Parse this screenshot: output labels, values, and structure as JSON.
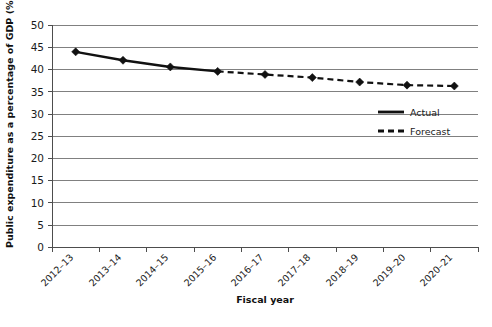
{
  "chart_data": {
    "type": "line",
    "title": "",
    "xlabel": "Fiscal year",
    "ylabel": "Public expenditure as a percentage of GDP (%)",
    "categories": [
      "2012–13",
      "2013–14",
      "2014–15",
      "2015–16",
      "2016–17",
      "2017–18",
      "2018–19",
      "2019–20",
      "2020–21"
    ],
    "ylim": [
      0,
      50
    ],
    "yticks": [
      0,
      5,
      10,
      15,
      20,
      25,
      30,
      35,
      40,
      45,
      50
    ],
    "ytick_labels": [
      "0",
      "5",
      "10",
      "15",
      "20",
      "25",
      "30",
      "35",
      "40",
      "45",
      "50"
    ],
    "grid": true,
    "legend_position": "right-inside",
    "series": [
      {
        "name": "Actual",
        "style": "solid",
        "x": [
          "2012–13",
          "2013–14",
          "2014–15",
          "2015–16"
        ],
        "values": [
          44.0,
          42.1,
          40.6,
          39.6
        ]
      },
      {
        "name": "Forecast",
        "style": "dashed",
        "x": [
          "2015–16",
          "2016–17",
          "2017–18",
          "2018–19",
          "2019–20",
          "2020–21"
        ],
        "values": [
          39.6,
          38.9,
          38.2,
          37.2,
          36.5,
          36.3
        ]
      }
    ],
    "colors": {
      "series_line": "#111111",
      "marker": "#111111",
      "gridline": "#808080",
      "axis": "#4d4d4d",
      "background": "#ffffff"
    }
  },
  "legend": {
    "items": [
      {
        "label": "Actual",
        "style": "solid"
      },
      {
        "label": "Forecast",
        "style": "dashed"
      }
    ]
  },
  "axes": {
    "y_title": "Public expenditure as a percentage of GDP (%)",
    "x_title": "Fiscal year",
    "y_ticks": [
      "50",
      "45",
      "40",
      "35",
      "30",
      "25",
      "20",
      "15",
      "10",
      "5",
      "0"
    ],
    "x_ticks": [
      "2012–13",
      "2013–14",
      "2014–15",
      "2015–16",
      "2016–17",
      "2017–18",
      "2018–19",
      "2019–20",
      "2020–21"
    ]
  }
}
